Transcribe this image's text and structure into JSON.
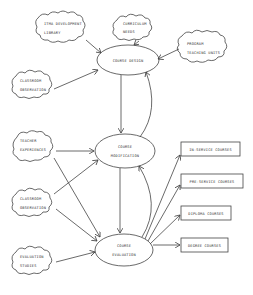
{
  "diagram": {
    "clouds": [
      {
        "id": "itma",
        "line1": "ITMA DEVELOPMENT",
        "line2": "LIBRARY"
      },
      {
        "id": "curriculum",
        "line1": "CURRICULUM",
        "line2": "NEEDS"
      },
      {
        "id": "program",
        "line1": "PROGRAM",
        "line2": "TEACHING UNITS"
      },
      {
        "id": "classroom1",
        "line1": "CLASSROOM",
        "line2": "OBSERVATION"
      },
      {
        "id": "teacher",
        "line1": "TEACHER",
        "line2": "EXPERIENCES"
      },
      {
        "id": "classroom2",
        "line1": "CLASSROOM",
        "line2": "OBSERVATION"
      },
      {
        "id": "evalstudies",
        "line1": "EVALUATION",
        "line2": "STUDIES"
      }
    ],
    "ellipses": [
      {
        "id": "design",
        "line1": "COURSE DESIGN",
        "line2": ""
      },
      {
        "id": "modification",
        "line1": "COURSE",
        "line2": "MODIFICATION"
      },
      {
        "id": "evaluation",
        "line1": "COURSE",
        "line2": "EVALUATION"
      }
    ],
    "boxes": [
      {
        "id": "inservice",
        "label": "IN-SERVICE COURSES"
      },
      {
        "id": "preservice",
        "label": "PRE-SERVICE COURSES"
      },
      {
        "id": "diploma",
        "label": "DIPLOMA COURSES"
      },
      {
        "id": "degree",
        "label": "DEGREE COURSES"
      }
    ],
    "colors": {
      "line": "#444444",
      "text": "#333333",
      "background": "#ffffff"
    }
  }
}
